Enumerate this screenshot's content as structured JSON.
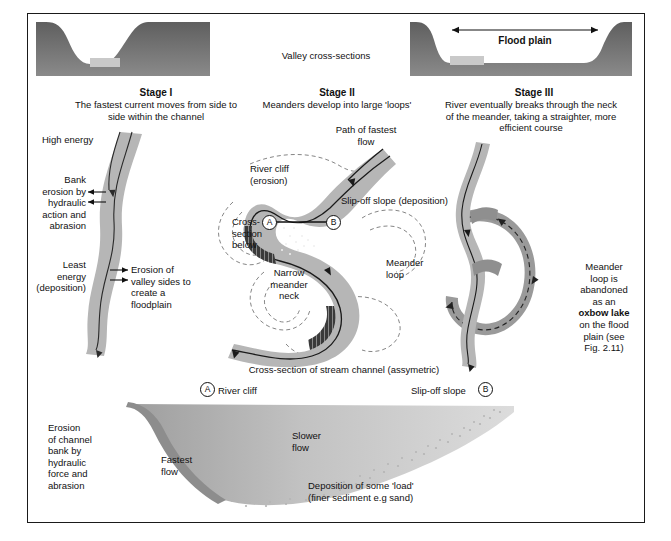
{
  "figure": {
    "top_caption": "Valley cross-sections",
    "flood_plain_label": "Flood plain",
    "mid_caption": "Cross-section of stream channel (assymetric)"
  },
  "stages": [
    {
      "id": "stage-1",
      "heading": "Stage I",
      "description": "The fastest current moves from side to\nside within the channel",
      "labels": {
        "high_energy": "High energy",
        "bank_erosion": "Bank\nerosion by\nhydraulic\naction and\nabrasion",
        "least_energy": "Least\nenergy\n(deposition)",
        "valley_erosion": "Erosion of\nvalley sides to\ncreate a\nfloodplain"
      }
    },
    {
      "id": "stage-2",
      "heading": "Stage II",
      "description": "Meanders develop into large 'loops'",
      "labels": {
        "path_fastest": "Path of fastest\nflow",
        "river_cliff": "River cliff\n(erosion)",
        "slip_off": "Slip-off slope (deposition)",
        "cross_section_below": "Cross-\nsection\nbelow",
        "narrow_neck": "Narrow\nmeander\nneck",
        "meander_loop": "Meander\nloop",
        "point_a": "A",
        "point_b": "B"
      }
    },
    {
      "id": "stage-3",
      "heading": "Stage III",
      "description": "River eventually breaks through the neck\nof the meander, taking a straighter, more\nefficient course",
      "labels": {
        "oxbow_pre": "Meander\nloop is\nabandoned\nas an",
        "oxbow_bold": "oxbow lake",
        "oxbow_post": "on the flood\nplain (see\nFig. 2.11)"
      }
    }
  ],
  "cross_section": {
    "point_a": "A",
    "point_b": "B",
    "river_cliff": "River cliff",
    "slip_off_slope": "Slip-off slope",
    "erosion": "Erosion\nof channel\nbank by\nhydraulic\nforce and\nabrasion",
    "fastest_flow": "Fastest\nflow",
    "slower_flow": "Slower\nflow",
    "deposition": "Deposition of some 'load'\n(finer sediment e.g sand)"
  },
  "colors": {
    "valley_fill": "#6e6e6e",
    "channel_block": "#c9c9c9",
    "river_fill": "#b6b6b6",
    "oxbow_fill": "#9a9a9a",
    "cliff_dark": "#3a3a3a",
    "ink": "#111111"
  }
}
